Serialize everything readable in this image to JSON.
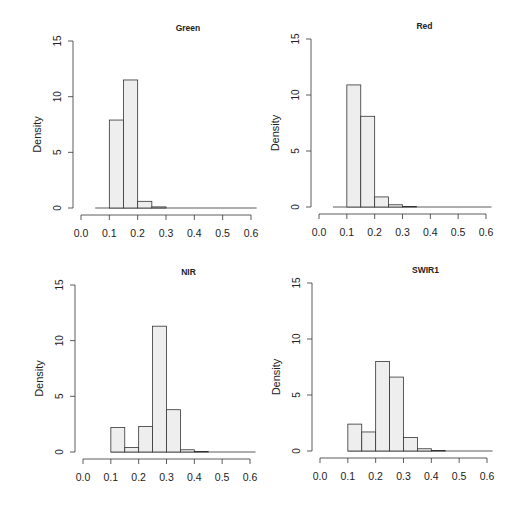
{
  "chart_data": [
    {
      "type": "bar",
      "title": "Green",
      "xlabel": "",
      "ylabel": "Density",
      "xlim": [
        0.0,
        0.6
      ],
      "ylim": [
        0,
        15
      ],
      "xticks": [
        "0.0",
        "0.1",
        "0.2",
        "0.3",
        "0.4",
        "0.5",
        "0.6"
      ],
      "yticks": [
        "0",
        "5",
        "10",
        "15"
      ],
      "bin_width": 0.05,
      "baseline_range": [
        0.05,
        0.62
      ],
      "bins": [
        {
          "from": 0.1,
          "to": 0.15,
          "density": 7.9
        },
        {
          "from": 0.15,
          "to": 0.2,
          "density": 11.5
        },
        {
          "from": 0.2,
          "to": 0.25,
          "density": 0.6
        },
        {
          "from": 0.25,
          "to": 0.3,
          "density": 0.1
        }
      ]
    },
    {
      "type": "bar",
      "title": "Red",
      "xlabel": "",
      "ylabel": "Density",
      "xlim": [
        0.0,
        0.6
      ],
      "ylim": [
        0,
        15
      ],
      "xticks": [
        "0.0",
        "0.1",
        "0.2",
        "0.3",
        "0.4",
        "0.5",
        "0.6"
      ],
      "yticks": [
        "0",
        "5",
        "10",
        "15"
      ],
      "bin_width": 0.05,
      "baseline_range": [
        0.05,
        0.62
      ],
      "bins": [
        {
          "from": 0.1,
          "to": 0.15,
          "density": 10.9
        },
        {
          "from": 0.15,
          "to": 0.2,
          "density": 8.1
        },
        {
          "from": 0.2,
          "to": 0.25,
          "density": 0.9
        },
        {
          "from": 0.25,
          "to": 0.3,
          "density": 0.2
        },
        {
          "from": 0.3,
          "to": 0.35,
          "density": 0.05
        }
      ]
    },
    {
      "type": "bar",
      "title": "NIR",
      "xlabel": "",
      "ylabel": "Density",
      "xlim": [
        0.0,
        0.6
      ],
      "ylim": [
        0,
        15
      ],
      "xticks": [
        "0.0",
        "0.1",
        "0.2",
        "0.3",
        "0.4",
        "0.5",
        "0.6"
      ],
      "yticks": [
        "0",
        "5",
        "10",
        "15"
      ],
      "bin_width": 0.05,
      "baseline_range": [
        0.1,
        0.62
      ],
      "bins": [
        {
          "from": 0.1,
          "to": 0.15,
          "density": 2.2
        },
        {
          "from": 0.15,
          "to": 0.2,
          "density": 0.4
        },
        {
          "from": 0.2,
          "to": 0.25,
          "density": 2.3
        },
        {
          "from": 0.25,
          "to": 0.3,
          "density": 11.3
        },
        {
          "from": 0.3,
          "to": 0.35,
          "density": 3.8
        },
        {
          "from": 0.35,
          "to": 0.4,
          "density": 0.2
        },
        {
          "from": 0.4,
          "to": 0.45,
          "density": 0.05
        }
      ]
    },
    {
      "type": "bar",
      "title": "SWIR1",
      "xlabel": "",
      "ylabel": "Density",
      "xlim": [
        0.0,
        0.6
      ],
      "ylim": [
        0,
        15
      ],
      "xticks": [
        "0.0",
        "0.1",
        "0.2",
        "0.3",
        "0.4",
        "0.5",
        "0.6"
      ],
      "yticks": [
        "0",
        "5",
        "10",
        "15"
      ],
      "bin_width": 0.05,
      "baseline_range": [
        0.1,
        0.62
      ],
      "bins": [
        {
          "from": 0.1,
          "to": 0.15,
          "density": 2.4
        },
        {
          "from": 0.15,
          "to": 0.2,
          "density": 1.7
        },
        {
          "from": 0.2,
          "to": 0.25,
          "density": 8.0
        },
        {
          "from": 0.25,
          "to": 0.3,
          "density": 6.6
        },
        {
          "from": 0.3,
          "to": 0.35,
          "density": 1.2
        },
        {
          "from": 0.35,
          "to": 0.4,
          "density": 0.2
        },
        {
          "from": 0.4,
          "to": 0.45,
          "density": 0.05
        }
      ]
    }
  ],
  "colors": {
    "bar_fill": "#eeeeee",
    "bar_stroke": "#333333",
    "axis": "#333333",
    "text": "#222222"
  },
  "layout": {
    "panels": [
      {
        "x0": 81,
        "x6": 251,
        "y0": 208,
        "y15": 41
      },
      {
        "x0": 319,
        "x6": 486,
        "y0": 207,
        "y15": 39
      },
      {
        "x0": 83,
        "x6": 250,
        "y0": 452,
        "y15": 285
      },
      {
        "x0": 320,
        "x6": 487,
        "y0": 451,
        "y15": 283
      }
    ]
  }
}
